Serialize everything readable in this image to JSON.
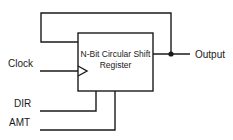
{
  "diagram": {
    "type": "block-diagram",
    "block": {
      "title_line1": "N-Bit Circular Shift",
      "title_line2": "Register"
    },
    "inputs": {
      "clock": "Clock",
      "dir": "DIR",
      "amt": "AMT"
    },
    "outputs": {
      "output": "Output"
    },
    "colors": {
      "line": "#1a1a1a",
      "background": "#ffffff"
    }
  }
}
